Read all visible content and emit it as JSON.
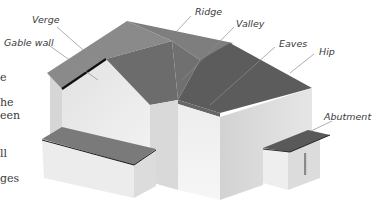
{
  "diagram": {
    "type": "roof-anatomy",
    "colors": {
      "roof_light": "#8a8a8a",
      "roof_mid": "#777777",
      "roof_dark": "#5f5f5f",
      "wall_light": "#ececec",
      "wall_mid": "#dcdcdc",
      "wall_shadow": "#c9c9c9",
      "edge_highlight": "#111111",
      "leader": "#8c8c8c"
    },
    "labels": [
      {
        "id": "verge",
        "text": "Verge"
      },
      {
        "id": "gable-wall",
        "text": "Gable wall"
      },
      {
        "id": "ridge",
        "text": "Ridge"
      },
      {
        "id": "valley",
        "text": "Valley"
      },
      {
        "id": "eaves",
        "text": "Eaves"
      },
      {
        "id": "hip",
        "text": "Hip"
      },
      {
        "id": "abutment",
        "text": "Abutment"
      }
    ],
    "left_text_fragments": [
      "e",
      "he",
      "een",
      "ll",
      "ges"
    ]
  }
}
